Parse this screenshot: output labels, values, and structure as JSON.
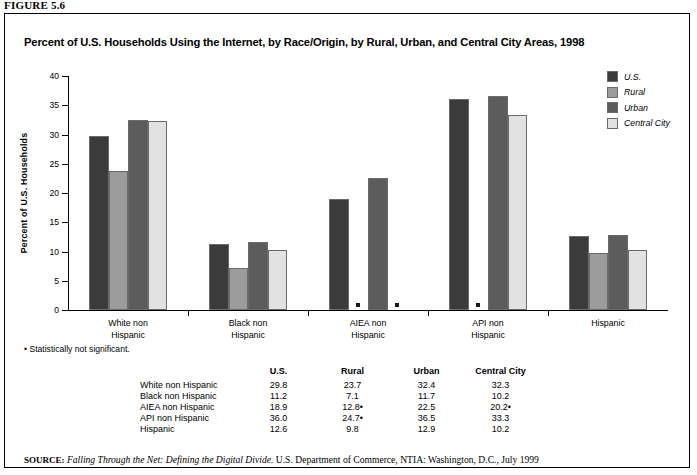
{
  "figure_caption": "FIGURE 5.6",
  "chart_title": "Percent of U.S. Households Using the Internet, by Race/Origin, by  Rural, Urban, and Central City Areas, 1998",
  "footnote": "• Statistically not significant.",
  "source": {
    "label": "SOURCE:",
    "italic_part": "Falling Through the Net: Defining the Digital Divide.",
    "rest": " U.S. Department of Commerce, NTIA: Washington, D.C., July 1999"
  },
  "legend": {
    "items": [
      {
        "label": "U.S.",
        "color": "#3b3b3b"
      },
      {
        "label": "Rural",
        "color": "#9c9c9c"
      },
      {
        "label": "Urban",
        "color": "#5c5c5c"
      },
      {
        "label": "Central City",
        "color": "#e2e2e2"
      }
    ]
  },
  "table": {
    "columns": [
      "U.S.",
      "Rural",
      "Urban",
      "Central City"
    ],
    "rows": [
      {
        "label": "White non Hispanic",
        "values": [
          "29.8",
          "23.7",
          "32.4",
          "32.3"
        ]
      },
      {
        "label": "Black non Hispanic",
        "values": [
          "11.2",
          "7.1",
          "11.7",
          "10.2"
        ]
      },
      {
        "label": "AIEA non Hispanic",
        "values": [
          "18.9",
          "12.8•",
          "22.5",
          "20.2•"
        ]
      },
      {
        "label": "API non Hispanic",
        "values": [
          "36.0",
          "24.7•",
          "36.5",
          "33.3"
        ]
      },
      {
        "label": "Hispanic",
        "values": [
          "12.6",
          "9.8",
          "12.9",
          "10.2"
        ]
      }
    ]
  },
  "chart_data": {
    "type": "bar",
    "title": "Percent of U.S. Households Using the Internet, by Race/Origin, by  Rural, Urban, and Central City Areas, 1998",
    "xlabel": "",
    "ylabel": "Percent of U.S. Households",
    "ylim": [
      0,
      40
    ],
    "yticks": [
      0,
      5,
      10,
      15,
      20,
      25,
      30,
      35,
      40
    ],
    "grid": false,
    "legend_position": "top-right",
    "categories": [
      "White non Hispanic",
      "Black non Hispanic",
      "AIEA non Hispanic",
      "API non Hispanic",
      "Hispanic"
    ],
    "category_lines": [
      [
        "White non",
        "Hispanic"
      ],
      [
        "Black non",
        "Hispanic"
      ],
      [
        "AIEA non",
        "Hispanic"
      ],
      [
        "API non",
        "Hispanic"
      ],
      [
        "Hispanic",
        ""
      ]
    ],
    "series": [
      {
        "name": "U.S.",
        "color": "#3b3b3b",
        "values": [
          29.8,
          11.2,
          18.9,
          36.0,
          12.6
        ],
        "suppressed": [
          false,
          false,
          false,
          false,
          false
        ]
      },
      {
        "name": "Rural",
        "color": "#9c9c9c",
        "values": [
          23.7,
          7.1,
          12.8,
          24.7,
          9.8
        ],
        "suppressed": [
          false,
          false,
          true,
          true,
          false
        ]
      },
      {
        "name": "Urban",
        "color": "#5c5c5c",
        "values": [
          32.4,
          11.7,
          22.5,
          36.5,
          12.9
        ],
        "suppressed": [
          false,
          false,
          false,
          false,
          false
        ]
      },
      {
        "name": "Central City",
        "color": "#e2e2e2",
        "values": [
          32.3,
          10.2,
          20.2,
          33.3,
          10.2
        ],
        "suppressed": [
          false,
          false,
          true,
          false,
          false
        ]
      }
    ],
    "suppressed_note": "Statistically not significant values are shown as a small dot at the baseline instead of a bar."
  }
}
